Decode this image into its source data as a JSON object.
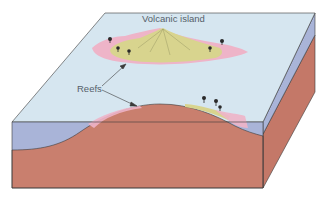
{
  "diagram": {
    "type": "block-diagram",
    "labels": {
      "island": "Volcanic island",
      "reefs": "Reefs"
    },
    "colors": {
      "water_surface": "#d6e6f0",
      "water_cross_section": "#a9b4d8",
      "seafloor_rock": "#c97f6e",
      "rock_side": "#c47868",
      "island_land": "#d8d48e",
      "reef": "#eeb4c8",
      "outline": "#3a3a3a",
      "label_text": "#55606a"
    },
    "annotations": [
      {
        "label": "Reefs",
        "arrow_to": "reef around island (top view)"
      },
      {
        "label": "Reefs",
        "arrow_to": "reef on cross-section slope"
      }
    ]
  }
}
